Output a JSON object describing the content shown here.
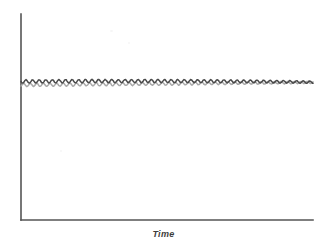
{
  "figure": {
    "background_color": "#ffffff",
    "axis_color": "#555555",
    "xlabel": "Time",
    "ylabel": ""
  },
  "chart_data": {
    "type": "line",
    "title": "",
    "xlabel": "Time",
    "ylabel": "",
    "xlim": [
      0,
      100
    ],
    "ylim": [
      0,
      100
    ],
    "grid": false,
    "legend_position": "none",
    "x_tick_labels": [],
    "y_tick_labels": [],
    "annotations": [],
    "axes_geometry": {
      "x_axis_start_px": 21,
      "x_axis_end_px": 313,
      "y_axis_top_px": 14,
      "y_axis_bottom_px": 220
    },
    "oscillation": {
      "period_px": 6.6,
      "amplitude_px": 1.6,
      "cycles": 44
    },
    "series": [
      {
        "name": "upper-series",
        "color": "#4a4a4a",
        "stroke_width": 1.5,
        "baseline_y_px": 81.5,
        "drift_px": -2.0,
        "phase": 0.0,
        "amplitude_px": 1.6
      },
      {
        "name": "lower-series",
        "color": "#aaaaaa",
        "stroke_width": 1.5,
        "baseline_y_px": 85.0,
        "drift_px": -2.6,
        "phase": 0.35,
        "amplitude_px": 1.5
      }
    ]
  }
}
